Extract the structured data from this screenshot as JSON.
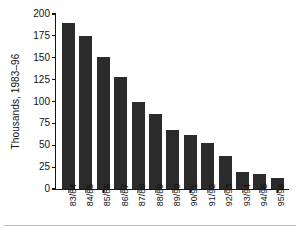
{
  "chart_data": {
    "type": "bar",
    "title": "",
    "subtitle": "",
    "xlabel": "",
    "ylabel": "Thousands, 1983–96",
    "categories": [
      "83/84",
      "84/85",
      "85/86",
      "86/87",
      "87/88",
      "88/89",
      "89/90",
      "90/91",
      "91/92",
      "92/93",
      "93/94",
      "94/95",
      "95/96"
    ],
    "values": [
      190,
      175,
      151,
      128,
      99,
      86,
      68,
      62,
      53,
      38,
      20,
      17,
      13
    ],
    "ylim": [
      0,
      200
    ],
    "yticks": [
      0,
      25,
      50,
      75,
      100,
      125,
      150,
      175,
      200
    ],
    "ytick_labels": [
      "0",
      "25",
      "50",
      "75",
      "100",
      "125",
      "150",
      "175",
      "200"
    ],
    "grid": false,
    "legend": null,
    "bar_color": "#2b2b2b",
    "axis_color": "#151515",
    "background_color": "#ffffff"
  }
}
